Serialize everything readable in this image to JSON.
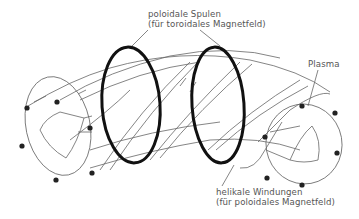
{
  "diagram": {
    "type": "stellarator-schematic",
    "labels": {
      "poloidal_coils": {
        "line1": "poloidale Spulen",
        "line2": "(für toroidales Magnetfeld)"
      },
      "plasma": "Plasma",
      "helical_windings": {
        "line1": "helikale Windungen",
        "line2": "(für poloidales Magnetfeld)"
      }
    },
    "colors": {
      "line": "#555555",
      "ring": "#111111",
      "dot": "#222222",
      "background": "#ffffff"
    }
  }
}
